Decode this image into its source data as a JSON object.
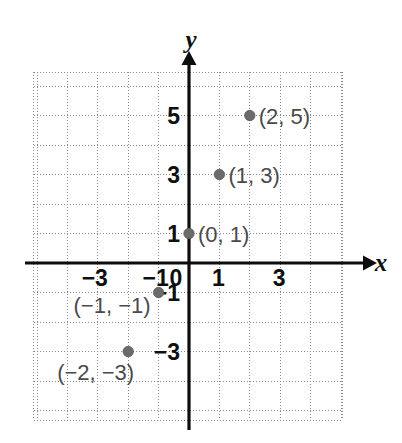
{
  "chart_data": {
    "type": "scatter",
    "title": "",
    "xlabel": "x",
    "ylabel": "y",
    "grid": true,
    "legend": false,
    "xlim": [
      -5.1,
      5.033
    ],
    "ylim": [
      -5.333,
      6.466
    ],
    "x_ticks": [
      -3,
      -1,
      0,
      1,
      3
    ],
    "x_tick_labels": [
      "−3",
      "−1",
      "0",
      "1",
      "3"
    ],
    "y_ticks": [
      5,
      3,
      1,
      -1,
      -3
    ],
    "y_tick_labels": [
      "5",
      "3",
      "1",
      "−1",
      "−3"
    ],
    "x_grid_step": 1,
    "y_grid_step": 1,
    "points": [
      {
        "x": 2,
        "y": 5,
        "label": "(2, 5)",
        "label_side": "right"
      },
      {
        "x": 1,
        "y": 3,
        "label": "(1, 3)",
        "label_side": "right"
      },
      {
        "x": 0,
        "y": 1,
        "label": "(0, 1)",
        "label_side": "right"
      },
      {
        "x": -1,
        "y": -1,
        "label": "(−1, −1)",
        "label_side": "left"
      },
      {
        "x": -2,
        "y": -3,
        "label": "(−2, −3)",
        "label_side": "belowleft"
      }
    ]
  },
  "axes": {
    "x_axis_name": "x",
    "y_axis_name": "y"
  },
  "colors": {
    "grid": "#8a8a8a",
    "axis": "#0d0d0d",
    "point": "#6b6b6b",
    "point_label": "#4a4a4a",
    "tick_label": "#0f0f0f",
    "background": "#ffffff"
  }
}
